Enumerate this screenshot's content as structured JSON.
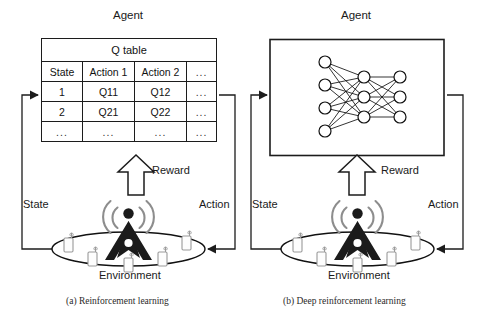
{
  "figure": {
    "panels": [
      {
        "id": "panel-a",
        "agent_label": "Agent",
        "caption": "(a)  Reinforcement learning",
        "state_label": "State",
        "action_label": "Action",
        "reward_label": "Reward",
        "environment_label": "Environment",
        "agent_content": "q-table",
        "q_table": {
          "title": "Q table",
          "headers": [
            "State",
            "Action 1",
            "Action 2",
            "..."
          ],
          "rows": [
            [
              "1",
              "Q11",
              "Q12",
              "..."
            ],
            [
              "2",
              "Q21",
              "Q22",
              "..."
            ],
            [
              "...",
              "...",
              "...",
              "..."
            ]
          ]
        }
      },
      {
        "id": "panel-b",
        "agent_label": "Agent",
        "caption": "(b)  Deep reinforcement learning",
        "state_label": "State",
        "action_label": "Action",
        "reward_label": "Reward",
        "environment_label": "Environment",
        "agent_content": "neural-network",
        "neural_network": {
          "layers": [
            4,
            3,
            3
          ],
          "layer_names": [
            "input",
            "hidden",
            "output"
          ],
          "node_radius": 6
        }
      }
    ],
    "icons": {
      "tower": "cell-tower-icon",
      "waves": "signal-wave-icon",
      "devices": "mobile-phone-icon",
      "device_count": 5,
      "reward_arrow": "up-block-arrow-icon",
      "state_arrow": "arrow-right-icon",
      "action_arrow": "arrow-left-icon"
    },
    "colors": {
      "stroke": "#1c1c1c",
      "text": "#121212",
      "wave": "#8d8d8d",
      "device": "#9a9a9a",
      "background": "#ffffff"
    }
  }
}
